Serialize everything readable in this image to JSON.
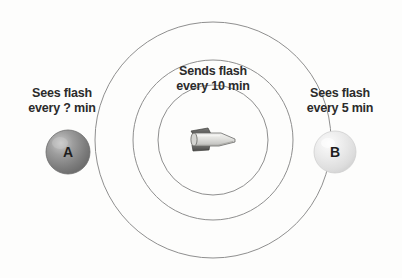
{
  "diagram": {
    "background_color": "#fdfdfc",
    "circle_stroke_color": "#8f8f8f",
    "text_color": "#2b2b2b",
    "center": {
      "x": 213,
      "y": 140
    },
    "wavefronts": [
      {
        "name": "inner-wavefront",
        "radius": 55
      },
      {
        "name": "middle-wavefront",
        "radius": 80
      },
      {
        "name": "outer-wavefront",
        "radius": 118
      }
    ],
    "emitter": {
      "icon": "rocket-icon",
      "label": "Sends flash",
      "label_line1": "Sends flash",
      "label_line2": "every 10 min",
      "interval_minutes": 10,
      "body_color_light": "#e9e9e7",
      "body_color_dark": "#5d5d5d"
    },
    "observers": [
      {
        "id": "A",
        "name": "observer-a",
        "letter": "A",
        "label_line1": "Sees flash",
        "label_line2": "every ? min",
        "interval_minutes": "?",
        "sphere_color": "#8a8a8a",
        "sphere_highlight": "#c9c9c9",
        "position": {
          "x": 68,
          "y": 152,
          "radius": 22
        }
      },
      {
        "id": "B",
        "name": "observer-b",
        "letter": "B",
        "label_line1": "Sees flash",
        "label_line2": "every 5 min",
        "interval_minutes": 5,
        "sphere_color": "#e4e4e4",
        "sphere_highlight": "#fafafa",
        "position": {
          "x": 335,
          "y": 152,
          "radius": 21
        }
      }
    ]
  }
}
